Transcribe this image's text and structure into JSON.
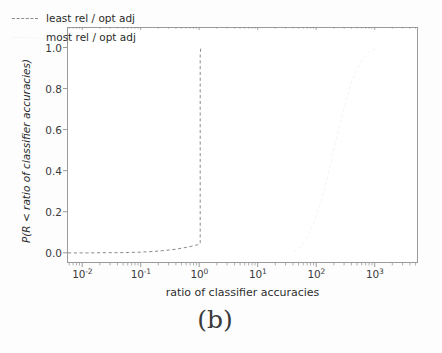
{
  "caption": "(b)",
  "legend": {
    "position": "upper-left-inside",
    "entries": [
      {
        "label": "least rel / opt adj",
        "color": "#8c8c8c",
        "style": "dashed"
      },
      {
        "label": "most rel / opt adj",
        "color": "#f4f4f4",
        "style": "dashed"
      }
    ]
  },
  "chart_data": {
    "type": "line",
    "title": "",
    "xlabel": "ratio of classifier accuracies",
    "ylabel": "P(R < ratio of classifier accuracies)",
    "xscale": "log",
    "yscale": "linear",
    "xlim": [
      0.0055,
      5500
    ],
    "ylim": [
      -0.05,
      1.1
    ],
    "grid": false,
    "xticks": [
      0.01,
      0.1,
      1,
      10,
      100,
      1000
    ],
    "xtick_labels": [
      "10⁻²",
      "10⁻¹",
      "10⁰",
      "10¹",
      "10²",
      "10³"
    ],
    "xtick_mantissas": [
      "10",
      "10",
      "10",
      "10",
      "10",
      "10"
    ],
    "xtick_exponents": [
      "-2",
      "-1",
      "0",
      "1",
      "2",
      "3"
    ],
    "yticks": [
      0.0,
      0.2,
      0.4,
      0.6,
      0.8,
      1.0
    ],
    "ytick_labels": [
      "0.0",
      "0.2",
      "0.4",
      "0.6",
      "0.8",
      "1.0"
    ],
    "series": [
      {
        "name": "least rel / opt adj",
        "color": "#8c8c8c",
        "style": "dashed",
        "x": [
          0.0055,
          0.008,
          0.012,
          0.02,
          0.035,
          0.06,
          0.1,
          0.16,
          0.25,
          0.38,
          0.55,
          0.7,
          0.82,
          0.9,
          0.95,
          0.98,
          1.0,
          1.0,
          1.0,
          1.02
        ],
        "y": [
          0.004,
          0.004,
          0.004,
          0.005,
          0.005,
          0.006,
          0.008,
          0.011,
          0.016,
          0.022,
          0.03,
          0.036,
          0.041,
          0.044,
          0.046,
          0.047,
          0.05,
          0.55,
          0.97,
          1.0
        ]
      },
      {
        "name": "most rel / opt adj",
        "color": "#f4f4f4",
        "style": "dashed",
        "x": [
          40,
          55,
          70,
          90,
          115,
          150,
          190,
          240,
          300,
          380,
          480,
          600,
          750,
          900,
          1100
        ],
        "y": [
          0.01,
          0.04,
          0.09,
          0.16,
          0.25,
          0.37,
          0.5,
          0.62,
          0.73,
          0.83,
          0.9,
          0.95,
          0.98,
          0.995,
          1.0
        ]
      }
    ]
  }
}
